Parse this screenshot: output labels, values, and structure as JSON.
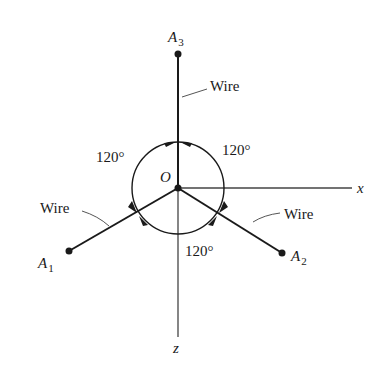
{
  "figure": {
    "colors": {
      "ink": "#1a1a1a",
      "leader": "#555555",
      "background": "#ffffff"
    },
    "origin": {
      "label": "O",
      "x": 178,
      "y": 188
    },
    "axes": {
      "x": {
        "label": "x",
        "end": [
          352,
          188
        ]
      },
      "z": {
        "label": "z",
        "end": [
          178,
          337
        ]
      }
    },
    "points": [
      {
        "name": "A",
        "sub": "1",
        "x": 69,
        "y": 251
      },
      {
        "name": "A",
        "sub": "2",
        "x": 282,
        "y": 253
      },
      {
        "name": "A",
        "sub": "3",
        "x": 178,
        "y": 54
      }
    ],
    "wire_labels": [
      {
        "text": "Wire",
        "target": "A3"
      },
      {
        "text": "Wire",
        "target": "A1"
      },
      {
        "text": "Wire",
        "target": "A2"
      }
    ],
    "angle_circle": {
      "radius": 46
    },
    "angle_labels": [
      {
        "text": "120°",
        "position": "upper-left"
      },
      {
        "text": "120°",
        "position": "upper-right"
      },
      {
        "text": "120°",
        "position": "bottom"
      }
    ]
  }
}
